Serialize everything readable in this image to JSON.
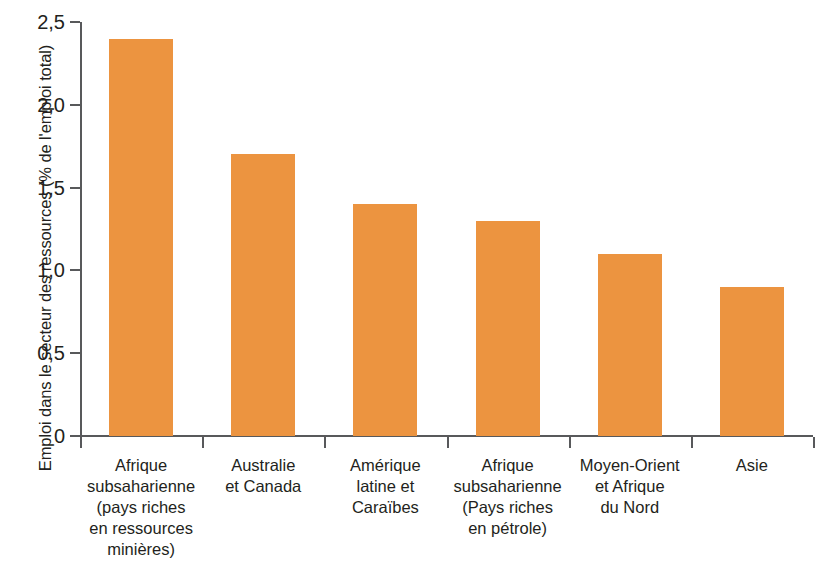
{
  "chart_data": {
    "type": "bar",
    "title": "",
    "subtitle": "",
    "xlabel": "",
    "ylabel": "Emploi dans le secteur des ressources (% de l'emploi total)",
    "ylim": [
      0,
      2.5
    ],
    "ytick_labels": [
      "2,5",
      "2,0",
      "1,5",
      "1,0",
      "0,5",
      "0"
    ],
    "ytick_values": [
      2.5,
      2.0,
      1.5,
      1.0,
      0.5,
      0
    ],
    "grid": false,
    "legend": null,
    "bar_color": "#ec9440",
    "axis_color": "#58595b",
    "background_color": "#ffffff",
    "categories": [
      "Afrique subsaharienne (pays riches en ressources minières)",
      "Australie et Canada",
      "Amérique latine et Caraïbes",
      "Afrique subsaharienne (Pays riches en pétrole)",
      "Moyen-Orient et Afrique du Nord",
      "Asie"
    ],
    "category_lines": [
      [
        "Afrique",
        "subsaharienne",
        "(pays riches",
        "en ressources",
        "minières)"
      ],
      [
        "Australie",
        "et Canada"
      ],
      [
        "Amérique",
        "latine et",
        "Caraïbes"
      ],
      [
        "Afrique",
        "subsaharienne",
        "(Pays riches",
        "en pétrole)"
      ],
      [
        "Moyen-Orient",
        "et Afrique",
        "du Nord"
      ],
      [
        "Asie"
      ]
    ],
    "values": [
      2.4,
      1.7,
      1.4,
      1.3,
      1.1,
      0.9
    ]
  }
}
